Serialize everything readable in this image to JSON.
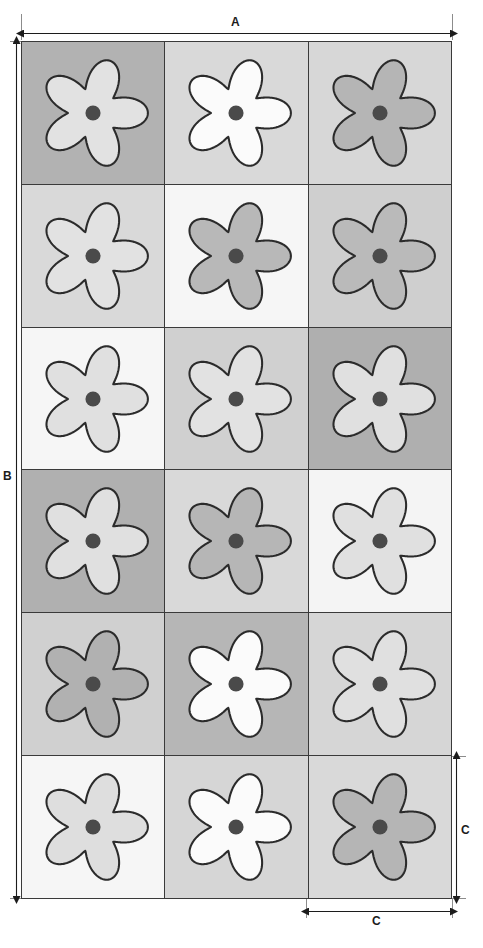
{
  "figure": {
    "type": "technical-dimension-drawing",
    "grid": {
      "columns": 3,
      "rows": 6,
      "total_tiles": 18
    },
    "outline_color": "#2b2b2b",
    "center_dot_color": "#4a4a4a"
  },
  "dimensions": {
    "width_label": "A",
    "height_label": "B",
    "tile_height_label": "C",
    "tile_width_label": "C"
  },
  "tiles": [
    {
      "row": 1,
      "col": 1,
      "background": "#b2b2b2",
      "flower": "#e2e2e2",
      "center": "#4a4a4a"
    },
    {
      "row": 1,
      "col": 2,
      "background": "#d9d9d9",
      "flower": "#fbfbfb",
      "center": "#4a4a4a"
    },
    {
      "row": 1,
      "col": 3,
      "background": "#d7d7d7",
      "flower": "#b5b5b5",
      "center": "#4a4a4a"
    },
    {
      "row": 2,
      "col": 1,
      "background": "#d9d9d9",
      "flower": "#e2e2e2",
      "center": "#4a4a4a"
    },
    {
      "row": 2,
      "col": 2,
      "background": "#f6f6f6",
      "flower": "#b8b8b8",
      "center": "#4a4a4a"
    },
    {
      "row": 2,
      "col": 3,
      "background": "#cfcfcf",
      "flower": "#bababa",
      "center": "#4a4a4a"
    },
    {
      "row": 3,
      "col": 1,
      "background": "#f6f6f6",
      "flower": "#e0e0e0",
      "center": "#4a4a4a"
    },
    {
      "row": 3,
      "col": 2,
      "background": "#d0d0d0",
      "flower": "#e2e2e2",
      "center": "#4a4a4a"
    },
    {
      "row": 3,
      "col": 3,
      "background": "#afafaf",
      "flower": "#e0e0e0",
      "center": "#4a4a4a"
    },
    {
      "row": 4,
      "col": 1,
      "background": "#b0b0b0",
      "flower": "#e0e0e0",
      "center": "#4a4a4a"
    },
    {
      "row": 4,
      "col": 2,
      "background": "#d9d9d9",
      "flower": "#b6b6b6",
      "center": "#4a4a4a"
    },
    {
      "row": 4,
      "col": 3,
      "background": "#f4f4f4",
      "flower": "#e0e0e0",
      "center": "#4a4a4a"
    },
    {
      "row": 5,
      "col": 1,
      "background": "#d0d0d0",
      "flower": "#b1b1b1",
      "center": "#4a4a4a"
    },
    {
      "row": 5,
      "col": 2,
      "background": "#b6b6b6",
      "flower": "#fbfbfb",
      "center": "#4a4a4a"
    },
    {
      "row": 5,
      "col": 3,
      "background": "#d6d6d6",
      "flower": "#e0e0e0",
      "center": "#4a4a4a"
    },
    {
      "row": 6,
      "col": 1,
      "background": "#f6f6f6",
      "flower": "#dedede",
      "center": "#4a4a4a"
    },
    {
      "row": 6,
      "col": 2,
      "background": "#d6d6d6",
      "flower": "#fbfbfb",
      "center": "#4a4a4a"
    },
    {
      "row": 6,
      "col": 3,
      "background": "#d9d9d9",
      "flower": "#b5b5b5",
      "center": "#4a4a4a"
    }
  ]
}
